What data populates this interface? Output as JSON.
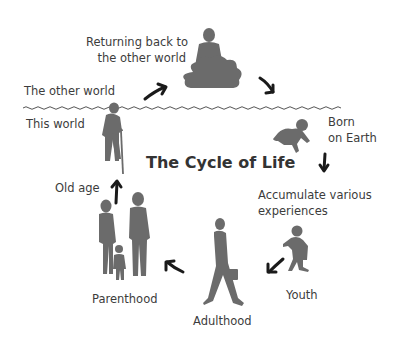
{
  "diagram": {
    "title": "The Cycle of Life",
    "colors": {
      "silhouette": "#6b6b6b",
      "arrow": "#1a1a1a",
      "text": "#3c3c3c",
      "wave": "#555555"
    },
    "boundary": {
      "above_label": "The other world",
      "below_label": "This world"
    },
    "stages": [
      {
        "id": "returning",
        "label_line1": "Returning back to",
        "label_line2": "the other world",
        "icon": "meditating-person-on-cloud-icon"
      },
      {
        "id": "born",
        "label_line1": "Born",
        "label_line2": "on Earth",
        "icon": "crawling-baby-icon"
      },
      {
        "id": "accumulate",
        "label_line1": "Accumulate various",
        "label_line2": "experiences",
        "icon": "none"
      },
      {
        "id": "youth",
        "label": "Youth",
        "icon": "walking-child-icon"
      },
      {
        "id": "adulthood",
        "label": "Adulthood",
        "icon": "walking-businessman-icon"
      },
      {
        "id": "parenthood",
        "label": "Parenthood",
        "icon": "family-icon"
      },
      {
        "id": "old_age",
        "label": "Old age",
        "icon": "elderly-with-cane-icon"
      }
    ],
    "arrows": [
      {
        "from": "old_age",
        "to": "returning"
      },
      {
        "from": "returning",
        "to": "born"
      },
      {
        "from": "born",
        "to": "accumulate"
      },
      {
        "from": "accumulate",
        "to": "youth"
      },
      {
        "from": "youth",
        "to": "adulthood"
      },
      {
        "from": "adulthood",
        "to": "parenthood"
      },
      {
        "from": "parenthood",
        "to": "old_age"
      }
    ]
  }
}
